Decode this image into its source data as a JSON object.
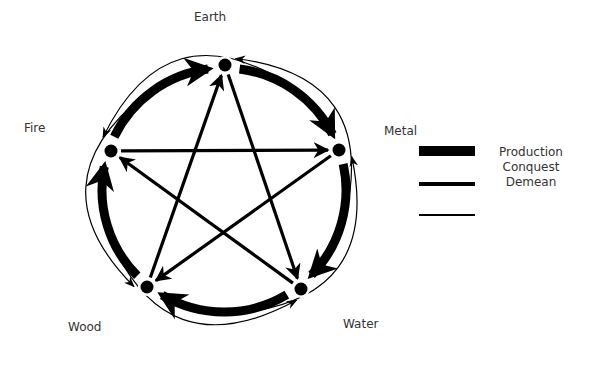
{
  "diagram": {
    "colors": {
      "ink": "#000000",
      "label": "#333333",
      "background": "#ffffff"
    },
    "nodes": [
      {
        "id": "earth",
        "label": "Earth"
      },
      {
        "id": "metal",
        "label": "Metal"
      },
      {
        "id": "water",
        "label": "Water"
      },
      {
        "id": "wood",
        "label": "Wood"
      },
      {
        "id": "fire",
        "label": "Fire"
      }
    ],
    "edges": {
      "production": [
        {
          "from": "wood",
          "to": "fire"
        },
        {
          "from": "fire",
          "to": "earth"
        },
        {
          "from": "earth",
          "to": "metal"
        },
        {
          "from": "metal",
          "to": "water"
        },
        {
          "from": "water",
          "to": "wood"
        }
      ],
      "conquest": [
        {
          "from": "wood",
          "to": "earth"
        },
        {
          "from": "earth",
          "to": "water"
        },
        {
          "from": "water",
          "to": "fire"
        },
        {
          "from": "fire",
          "to": "metal"
        },
        {
          "from": "metal",
          "to": "wood"
        }
      ],
      "demean": [
        {
          "from": "metal",
          "to": "earth"
        },
        {
          "from": "earth",
          "to": "fire"
        },
        {
          "from": "fire",
          "to": "wood"
        },
        {
          "from": "wood",
          "to": "water"
        },
        {
          "from": "water",
          "to": "metal"
        }
      ]
    },
    "legend": [
      {
        "label": "Production",
        "style": "thick"
      },
      {
        "label": "Conquest",
        "style": "medium"
      },
      {
        "label": "Demean",
        "style": "thin"
      }
    ]
  }
}
